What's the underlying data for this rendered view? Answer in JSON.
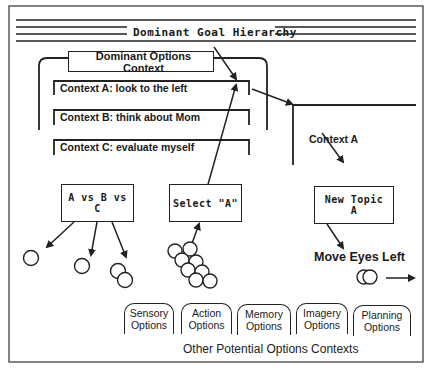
{
  "title": "Dominant Goal Hierarchy",
  "dominant_options": {
    "label": "Dominant Options Context",
    "contexts": [
      {
        "label": "Context A: look to the left"
      },
      {
        "label": "Context B: think about Mom"
      },
      {
        "label": "Context C: evaluate myself"
      }
    ]
  },
  "right_context": {
    "label": "Context A"
  },
  "process_boxes": [
    {
      "label": "A vs B vs C"
    },
    {
      "label": "Select \"A\""
    },
    {
      "label_line1": "New Topic",
      "label_line2": "A"
    }
  ],
  "action": {
    "label": "Move Eyes Left"
  },
  "other_contexts": {
    "caption": "Other Potential Options Contexts",
    "tabs": [
      {
        "line1": "Sensory",
        "line2": "Options"
      },
      {
        "line1": "Action",
        "line2": "Options"
      },
      {
        "line1": "Memory",
        "line2": "Options"
      },
      {
        "line1": "Imagery",
        "line2": "Options"
      },
      {
        "line1": "Planning",
        "line2": "Options"
      }
    ]
  }
}
